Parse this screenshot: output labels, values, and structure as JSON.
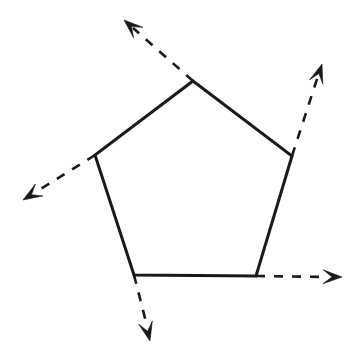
{
  "figure": {
    "kind": "geometry-diagram",
    "shape_name": "pentagon",
    "background_color": "#ffffff",
    "stroke_color": "#1a1a1a",
    "canvas": {
      "width": 359,
      "height": 360
    },
    "polygon": {
      "name": "pentagon",
      "sides": 5,
      "closed": true,
      "line_style": "solid",
      "stroke_width": 3,
      "vertices": [
        {
          "id": "top",
          "label": "A",
          "x": 193,
          "y": 81
        },
        {
          "id": "right",
          "label": "B",
          "x": 292,
          "y": 156
        },
        {
          "id": "bottom-right",
          "label": "C",
          "x": 256,
          "y": 276
        },
        {
          "id": "bottom-left",
          "label": "D",
          "x": 134,
          "y": 275
        },
        {
          "id": "left",
          "label": "E",
          "x": 95,
          "y": 155
        }
      ],
      "points_attr": "193,81 292,156 256,276 134,275 95,155"
    },
    "rays": [
      {
        "id": "ray-top-left",
        "name": "exterior-ray-top",
        "from_vertex": "top",
        "direction": "up-left",
        "line_style": "dashed",
        "dash_pattern": "9 9",
        "start": {
          "x": 193,
          "y": 81
        },
        "end": {
          "x": 133,
          "y": 28
        },
        "tip": {
          "x": 124,
          "y": 20
        },
        "arrowhead": "barbed"
      },
      {
        "id": "ray-right-up",
        "name": "exterior-ray-right",
        "from_vertex": "right",
        "direction": "up-right",
        "line_style": "dashed",
        "dash_pattern": "9 9",
        "start": {
          "x": 292,
          "y": 156
        },
        "end": {
          "x": 318,
          "y": 76
        },
        "tip": {
          "x": 322,
          "y": 64
        },
        "arrowhead": "barbed"
      },
      {
        "id": "ray-left-down",
        "name": "exterior-ray-left",
        "from_vertex": "left",
        "direction": "down-left",
        "line_style": "dashed",
        "dash_pattern": "9 9",
        "start": {
          "x": 95,
          "y": 155
        },
        "end": {
          "x": 36,
          "y": 192
        },
        "tip": {
          "x": 23,
          "y": 200
        },
        "arrowhead": "barbed"
      },
      {
        "id": "ray-bottom-right-horizontal",
        "name": "exterior-ray-bottom-right",
        "from_vertex": "bottom-right",
        "direction": "right",
        "line_style": "dashed",
        "dash_pattern": "9 9",
        "start": {
          "x": 256,
          "y": 276
        },
        "end": {
          "x": 325,
          "y": 277
        },
        "tip": {
          "x": 342,
          "y": 277
        },
        "arrowhead": "barbed"
      },
      {
        "id": "ray-bottom-down",
        "name": "exterior-ray-bottom-left",
        "from_vertex": "bottom-left",
        "direction": "down",
        "line_style": "dashed",
        "dash_pattern": "9 9",
        "start": {
          "x": 134,
          "y": 275
        },
        "end": {
          "x": 146,
          "y": 322
        },
        "tip": {
          "x": 150,
          "y": 341
        },
        "arrowhead": "barbed"
      }
    ],
    "labels": [],
    "annotations": []
  },
  "chart_data": {
    "type": "diagram",
    "shape": "pentagon",
    "vertex_count": 5,
    "ray_count": 5,
    "vertices_xy": [
      [
        193,
        81
      ],
      [
        292,
        156
      ],
      [
        256,
        276
      ],
      [
        134,
        275
      ],
      [
        95,
        155
      ]
    ],
    "ray_tips_xy": [
      [
        124,
        20
      ],
      [
        322,
        64
      ],
      [
        23,
        200
      ],
      [
        342,
        277
      ],
      [
        150,
        341
      ]
    ]
  }
}
